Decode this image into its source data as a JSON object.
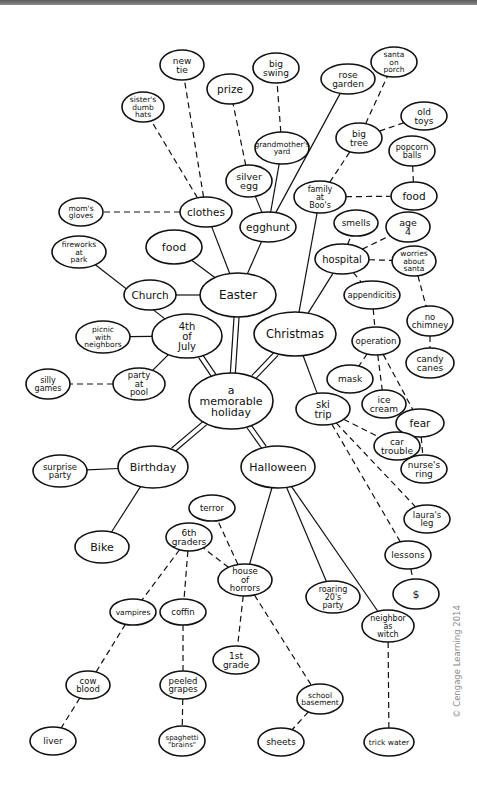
{
  "diagram": {
    "type": "mind-map",
    "center": {
      "id": "center",
      "label": "a memorable holiday"
    },
    "nodes": [
      {
        "id": "center",
        "lines": [
          "a",
          "memorable",
          "holiday"
        ],
        "x": 231,
        "y": 401,
        "rx": 42,
        "ry": 28,
        "fs": 11
      },
      {
        "id": "easter",
        "lines": [
          "Easter"
        ],
        "x": 238,
        "y": 295,
        "rx": 38,
        "ry": 22,
        "fs": 12
      },
      {
        "id": "christmas",
        "lines": [
          "Christmas"
        ],
        "x": 295,
        "y": 334,
        "rx": 41,
        "ry": 22,
        "fs": 11.5
      },
      {
        "id": "july4",
        "lines": [
          "4th",
          "of",
          "July"
        ],
        "x": 187,
        "y": 336,
        "rx": 35,
        "ry": 22,
        "fs": 10
      },
      {
        "id": "birthday",
        "lines": [
          "Birthday"
        ],
        "x": 153,
        "y": 467,
        "rx": 35,
        "ry": 21,
        "fs": 11
      },
      {
        "id": "halloween",
        "lines": [
          "Halloween"
        ],
        "x": 278,
        "y": 467,
        "rx": 37,
        "ry": 21,
        "fs": 11
      },
      {
        "id": "clothes",
        "lines": [
          "clothes"
        ],
        "x": 206,
        "y": 212,
        "rx": 26,
        "ry": 15,
        "fs": 10.5
      },
      {
        "id": "egghunt",
        "lines": [
          "egghunt"
        ],
        "x": 268,
        "y": 227,
        "rx": 28,
        "ry": 15,
        "fs": 10.5
      },
      {
        "id": "food-easter",
        "lines": [
          "food"
        ],
        "x": 174,
        "y": 247,
        "rx": 28,
        "ry": 17,
        "fs": 11
      },
      {
        "id": "church",
        "lines": [
          "Church"
        ],
        "x": 150,
        "y": 295,
        "rx": 26,
        "ry": 15,
        "fs": 10.5
      },
      {
        "id": "new-tie",
        "lines": [
          "new",
          "tie"
        ],
        "x": 182,
        "y": 65,
        "rx": 22,
        "ry": 15,
        "fs": 9
      },
      {
        "id": "sisters-hats",
        "lines": [
          "sister's",
          "dumb",
          "hats"
        ],
        "x": 143,
        "y": 107,
        "rx": 21,
        "ry": 15,
        "fs": 7.5
      },
      {
        "id": "moms-gloves",
        "lines": [
          "mom's",
          "gloves"
        ],
        "x": 81,
        "y": 212,
        "rx": 22,
        "ry": 14,
        "fs": 7.5
      },
      {
        "id": "prize",
        "lines": [
          "prize"
        ],
        "x": 230,
        "y": 89,
        "rx": 23,
        "ry": 15,
        "fs": 10.5
      },
      {
        "id": "big-swing",
        "lines": [
          "big",
          "swing"
        ],
        "x": 276,
        "y": 68,
        "rx": 23,
        "ry": 15,
        "fs": 9
      },
      {
        "id": "grandmothers-yard",
        "lines": [
          "grandmother's",
          "yard"
        ],
        "x": 282,
        "y": 148,
        "rx": 27,
        "ry": 16,
        "fs": 7.5
      },
      {
        "id": "silver-egg",
        "lines": [
          "silver",
          "egg"
        ],
        "x": 249,
        "y": 181,
        "rx": 23,
        "ry": 16,
        "fs": 9.5
      },
      {
        "id": "rose-garden",
        "lines": [
          "rose",
          "garden"
        ],
        "x": 348,
        "y": 79,
        "rx": 27,
        "ry": 15,
        "fs": 9
      },
      {
        "id": "family-boos",
        "lines": [
          "family",
          "at",
          "Boo's"
        ],
        "x": 320,
        "y": 197,
        "rx": 26,
        "ry": 16,
        "fs": 8
      },
      {
        "id": "santa-porch",
        "lines": [
          "santa",
          "on",
          "porch"
        ],
        "x": 394,
        "y": 62,
        "rx": 23,
        "ry": 15,
        "fs": 7.5
      },
      {
        "id": "big-tree",
        "lines": [
          "big",
          "tree"
        ],
        "x": 359,
        "y": 138,
        "rx": 23,
        "ry": 15,
        "fs": 9
      },
      {
        "id": "old-toys",
        "lines": [
          "old",
          "toys"
        ],
        "x": 424,
        "y": 116,
        "rx": 23,
        "ry": 14,
        "fs": 9
      },
      {
        "id": "popcorn-balls",
        "lines": [
          "popcorn",
          "balls"
        ],
        "x": 412,
        "y": 151,
        "rx": 23,
        "ry": 15,
        "fs": 8
      },
      {
        "id": "food-christmas",
        "lines": [
          "food"
        ],
        "x": 414,
        "y": 196,
        "rx": 23,
        "ry": 14,
        "fs": 10.5
      },
      {
        "id": "smells",
        "lines": [
          "smells"
        ],
        "x": 356,
        "y": 223,
        "rx": 22,
        "ry": 13,
        "fs": 9
      },
      {
        "id": "age-4",
        "lines": [
          "age",
          "4"
        ],
        "x": 408,
        "y": 227,
        "rx": 22,
        "ry": 15,
        "fs": 9.5
      },
      {
        "id": "hospital",
        "lines": [
          "hospital"
        ],
        "x": 342,
        "y": 259,
        "rx": 27,
        "ry": 15,
        "fs": 10
      },
      {
        "id": "worries-santa",
        "lines": [
          "worries",
          "about",
          "santa"
        ],
        "x": 414,
        "y": 261,
        "rx": 22,
        "ry": 15,
        "fs": 7.5
      },
      {
        "id": "appendicitis",
        "lines": [
          "appendicitis"
        ],
        "x": 372,
        "y": 295,
        "rx": 28,
        "ry": 14,
        "fs": 8
      },
      {
        "id": "no-chimney",
        "lines": [
          "no",
          "chimney"
        ],
        "x": 430,
        "y": 321,
        "rx": 23,
        "ry": 15,
        "fs": 8.5
      },
      {
        "id": "operation",
        "lines": [
          "operation"
        ],
        "x": 376,
        "y": 341,
        "rx": 24,
        "ry": 14,
        "fs": 8.5
      },
      {
        "id": "candy-canes",
        "lines": [
          "candy",
          "canes"
        ],
        "x": 430,
        "y": 363,
        "rx": 24,
        "ry": 15,
        "fs": 9
      },
      {
        "id": "mask",
        "lines": [
          "mask"
        ],
        "x": 350,
        "y": 379,
        "rx": 23,
        "ry": 14,
        "fs": 9
      },
      {
        "id": "ice-cream",
        "lines": [
          "ice",
          "cream"
        ],
        "x": 384,
        "y": 404,
        "rx": 22,
        "ry": 14,
        "fs": 9
      },
      {
        "id": "ski-trip",
        "lines": [
          "ski",
          "trip"
        ],
        "x": 323,
        "y": 409,
        "rx": 27,
        "ry": 16,
        "fs": 10
      },
      {
        "id": "fear",
        "lines": [
          "fear"
        ],
        "x": 420,
        "y": 423,
        "rx": 24,
        "ry": 14,
        "fs": 10.5
      },
      {
        "id": "car-trouble",
        "lines": [
          "car",
          "trouble"
        ],
        "x": 397,
        "y": 446,
        "rx": 23,
        "ry": 14,
        "fs": 9
      },
      {
        "id": "nurses-ring",
        "lines": [
          "nurse's",
          "ring"
        ],
        "x": 424,
        "y": 469,
        "rx": 23,
        "ry": 14,
        "fs": 9
      },
      {
        "id": "lauras-leg",
        "lines": [
          "laura's",
          "leg"
        ],
        "x": 427,
        "y": 519,
        "rx": 23,
        "ry": 14,
        "fs": 8.5
      },
      {
        "id": "lessons",
        "lines": [
          "lessons"
        ],
        "x": 408,
        "y": 555,
        "rx": 23,
        "ry": 14,
        "fs": 9
      },
      {
        "id": "dollar",
        "lines": [
          "$"
        ],
        "x": 416,
        "y": 594,
        "rx": 23,
        "ry": 15,
        "fs": 11
      },
      {
        "id": "fireworks-park",
        "lines": [
          "fireworks",
          "at",
          "park"
        ],
        "x": 79,
        "y": 252,
        "rx": 27,
        "ry": 16,
        "fs": 7.5
      },
      {
        "id": "picnic-neighbors",
        "lines": [
          "picnic",
          "with",
          "neighbors"
        ],
        "x": 103,
        "y": 337,
        "rx": 27,
        "ry": 16,
        "fs": 7.5
      },
      {
        "id": "silly-games",
        "lines": [
          "silly",
          "games"
        ],
        "x": 48,
        "y": 384,
        "rx": 22,
        "ry": 15,
        "fs": 8
      },
      {
        "id": "party-pool",
        "lines": [
          "party",
          "at",
          "pool"
        ],
        "x": 139,
        "y": 384,
        "rx": 26,
        "ry": 16,
        "fs": 8.5
      },
      {
        "id": "surprise-party",
        "lines": [
          "surprise",
          "party"
        ],
        "x": 60,
        "y": 471,
        "rx": 27,
        "ry": 16,
        "fs": 8.5
      },
      {
        "id": "bike",
        "lines": [
          "Bike"
        ],
        "x": 102,
        "y": 547,
        "rx": 27,
        "ry": 16,
        "fs": 11
      },
      {
        "id": "terror",
        "lines": [
          "terror"
        ],
        "x": 212,
        "y": 508,
        "rx": 23,
        "ry": 13,
        "fs": 8.5
      },
      {
        "id": "6th-graders",
        "lines": [
          "6th",
          "graders"
        ],
        "x": 189,
        "y": 537,
        "rx": 23,
        "ry": 14,
        "fs": 9
      },
      {
        "id": "house-horrors",
        "lines": [
          "house",
          "of",
          "horrors"
        ],
        "x": 245,
        "y": 580,
        "rx": 27,
        "ry": 16,
        "fs": 8.5
      },
      {
        "id": "roaring-20s",
        "lines": [
          "roaring",
          "20's",
          "party"
        ],
        "x": 333,
        "y": 597,
        "rx": 27,
        "ry": 16,
        "fs": 8
      },
      {
        "id": "vampires",
        "lines": [
          "vampires"
        ],
        "x": 133,
        "y": 612,
        "rx": 23,
        "ry": 13,
        "fs": 7.5
      },
      {
        "id": "coffin",
        "lines": [
          "coffin"
        ],
        "x": 183,
        "y": 612,
        "rx": 23,
        "ry": 13,
        "fs": 8.5
      },
      {
        "id": "neighbor-witch",
        "lines": [
          "neighbor",
          "as",
          "witch"
        ],
        "x": 388,
        "y": 626,
        "rx": 26,
        "ry": 16,
        "fs": 8
      },
      {
        "id": "1st-grade",
        "lines": [
          "1st",
          "grade"
        ],
        "x": 236,
        "y": 660,
        "rx": 23,
        "ry": 14,
        "fs": 9
      },
      {
        "id": "cow-blood",
        "lines": [
          "cow",
          "blood"
        ],
        "x": 88,
        "y": 685,
        "rx": 22,
        "ry": 14,
        "fs": 8.5
      },
      {
        "id": "peeled-grapes",
        "lines": [
          "peeled",
          "grapes"
        ],
        "x": 183,
        "y": 685,
        "rx": 23,
        "ry": 14,
        "fs": 8.5
      },
      {
        "id": "school-basement",
        "lines": [
          "school",
          "basement"
        ],
        "x": 320,
        "y": 699,
        "rx": 23,
        "ry": 15,
        "fs": 7.5
      },
      {
        "id": "liver",
        "lines": [
          "liver"
        ],
        "x": 53,
        "y": 741,
        "rx": 23,
        "ry": 14,
        "fs": 9
      },
      {
        "id": "spaghetti-brains",
        "lines": [
          "spaghetti",
          "\"brains\""
        ],
        "x": 182,
        "y": 741,
        "rx": 23,
        "ry": 15,
        "fs": 7
      },
      {
        "id": "sheets",
        "lines": [
          "sheets"
        ],
        "x": 281,
        "y": 742,
        "rx": 23,
        "ry": 14,
        "fs": 9
      },
      {
        "id": "trick-water",
        "lines": [
          "trick water"
        ],
        "x": 389,
        "y": 742,
        "rx": 25,
        "ry": 14,
        "fs": 7.5
      }
    ],
    "edges": [
      {
        "from": "center",
        "to": "easter",
        "style": "double"
      },
      {
        "from": "center",
        "to": "christmas",
        "style": "double"
      },
      {
        "from": "center",
        "to": "july4",
        "style": "double"
      },
      {
        "from": "center",
        "to": "birthday",
        "style": "double"
      },
      {
        "from": "center",
        "to": "halloween",
        "style": "double"
      },
      {
        "from": "easter",
        "to": "clothes",
        "style": "solid"
      },
      {
        "from": "easter",
        "to": "egghunt",
        "style": "solid"
      },
      {
        "from": "easter",
        "to": "food-easter",
        "style": "solid"
      },
      {
        "from": "easter",
        "to": "church",
        "style": "solid"
      },
      {
        "from": "clothes",
        "to": "new-tie",
        "style": "dashed"
      },
      {
        "from": "clothes",
        "to": "sisters-hats",
        "style": "dashed"
      },
      {
        "from": "clothes",
        "to": "moms-gloves",
        "style": "dashed"
      },
      {
        "from": "egghunt",
        "to": "silver-egg",
        "style": "solid"
      },
      {
        "from": "egghunt",
        "to": "grandmothers-yard",
        "style": "solid"
      },
      {
        "from": "egghunt",
        "to": "rose-garden",
        "style": "solid"
      },
      {
        "from": "silver-egg",
        "to": "prize",
        "style": "dashed"
      },
      {
        "from": "grandmothers-yard",
        "to": "big-swing",
        "style": "dashed"
      },
      {
        "from": "christmas",
        "to": "family-boos",
        "style": "solid"
      },
      {
        "from": "christmas",
        "to": "hospital",
        "style": "solid"
      },
      {
        "from": "christmas",
        "to": "ski-trip",
        "style": "solid"
      },
      {
        "from": "family-boos",
        "to": "big-tree",
        "style": "dashed"
      },
      {
        "from": "family-boos",
        "to": "food-christmas",
        "style": "dashed"
      },
      {
        "from": "big-tree",
        "to": "santa-porch",
        "style": "dashed"
      },
      {
        "from": "big-tree",
        "to": "old-toys",
        "style": "dashed"
      },
      {
        "from": "food-christmas",
        "to": "popcorn-balls",
        "style": "dashed"
      },
      {
        "from": "hospital",
        "to": "smells",
        "style": "dashed"
      },
      {
        "from": "hospital",
        "to": "age-4",
        "style": "dashed"
      },
      {
        "from": "hospital",
        "to": "worries-santa",
        "style": "dashed"
      },
      {
        "from": "hospital",
        "to": "appendicitis",
        "style": "dashed"
      },
      {
        "from": "worries-santa",
        "to": "no-chimney",
        "style": "dashed"
      },
      {
        "from": "no-chimney",
        "to": "candy-canes",
        "style": "dashed"
      },
      {
        "from": "appendicitis",
        "to": "operation",
        "style": "dashed"
      },
      {
        "from": "operation",
        "to": "mask",
        "style": "dashed"
      },
      {
        "from": "operation",
        "to": "ice-cream",
        "style": "dashed"
      },
      {
        "from": "operation",
        "to": "fear",
        "style": "dashed"
      },
      {
        "from": "fear",
        "to": "nurses-ring",
        "style": "dashed"
      },
      {
        "from": "ski-trip",
        "to": "car-trouble",
        "style": "dashed"
      },
      {
        "from": "ski-trip",
        "to": "lauras-leg",
        "style": "dashed"
      },
      {
        "from": "ski-trip",
        "to": "lessons",
        "style": "dashed"
      },
      {
        "from": "lessons",
        "to": "dollar",
        "style": "dashed"
      },
      {
        "from": "july4",
        "to": "fireworks-park",
        "style": "solid"
      },
      {
        "from": "july4",
        "to": "picnic-neighbors",
        "style": "solid"
      },
      {
        "from": "july4",
        "to": "party-pool",
        "style": "solid"
      },
      {
        "from": "party-pool",
        "to": "silly-games",
        "style": "dashed"
      },
      {
        "from": "birthday",
        "to": "surprise-party",
        "style": "solid"
      },
      {
        "from": "birthday",
        "to": "bike",
        "style": "solid"
      },
      {
        "from": "halloween",
        "to": "house-horrors",
        "style": "solid"
      },
      {
        "from": "halloween",
        "to": "roaring-20s",
        "style": "solid"
      },
      {
        "from": "halloween",
        "to": "neighbor-witch",
        "style": "solid"
      },
      {
        "from": "house-horrors",
        "to": "terror",
        "style": "dashed"
      },
      {
        "from": "house-horrors",
        "to": "6th-graders",
        "style": "dashed"
      },
      {
        "from": "house-horrors",
        "to": "1st-grade",
        "style": "dashed"
      },
      {
        "from": "house-horrors",
        "to": "school-basement",
        "style": "dashed"
      },
      {
        "from": "6th-graders",
        "to": "vampires",
        "style": "dashed"
      },
      {
        "from": "6th-graders",
        "to": "coffin",
        "style": "dashed"
      },
      {
        "from": "vampires",
        "to": "cow-blood",
        "style": "dashed"
      },
      {
        "from": "cow-blood",
        "to": "liver",
        "style": "dashed"
      },
      {
        "from": "coffin",
        "to": "peeled-grapes",
        "style": "dashed"
      },
      {
        "from": "peeled-grapes",
        "to": "spaghetti-brains",
        "style": "dashed"
      },
      {
        "from": "school-basement",
        "to": "sheets",
        "style": "dashed"
      },
      {
        "from": "neighbor-witch",
        "to": "trick-water",
        "style": "dashed"
      }
    ]
  },
  "credit": "© Cengage Learning 2014"
}
